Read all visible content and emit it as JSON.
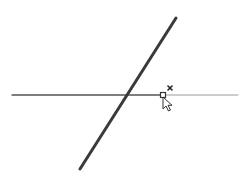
{
  "canvas": {
    "background": "#ffffff",
    "width": 251,
    "height": 179
  },
  "lines": {
    "diagonal": {
      "x1": 176,
      "y1": 18,
      "x2": 80,
      "y2": 169,
      "color": "#3a3a3a",
      "stroke_width": 3
    },
    "horizontal_drawn": {
      "x1": 12,
      "y1": 95,
      "x2": 163,
      "y2": 95,
      "color": "#555555",
      "stroke_width": 1.3
    },
    "horizontal_extension": {
      "x1": 163,
      "y1": 95,
      "x2": 238,
      "y2": 95,
      "color": "#9a9a9a",
      "stroke_width": 1
    }
  },
  "snap_marker": {
    "type": "endpoint-square",
    "x": 163,
    "y": 95,
    "size": 5,
    "color": "#333333"
  },
  "close_marker": {
    "type": "x-mark",
    "x": 170,
    "y": 88,
    "size": 4,
    "color": "#222222"
  },
  "cursor": {
    "type": "arrow-pointer",
    "x": 163,
    "y": 97,
    "fill": "#ffffff",
    "stroke": "#333333"
  }
}
